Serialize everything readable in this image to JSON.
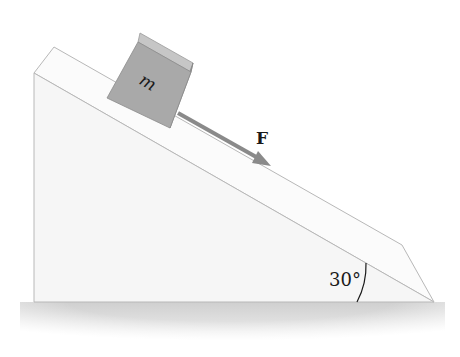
{
  "diagram": {
    "block": {
      "label": "m",
      "fill": "#a8a8a8",
      "top_fill": "#c8c8c8",
      "side_fill": "#8f8f8f"
    },
    "force": {
      "label": "F",
      "color": "#8a8a8a",
      "direction": "down the incline"
    },
    "incline": {
      "angle_label": "30°",
      "face_fill": "#f7f7f7",
      "top_fill": "#fbfbfb",
      "edge_color": "#b5b5b5"
    },
    "shadow": {
      "color": "#d4d4d4"
    }
  }
}
